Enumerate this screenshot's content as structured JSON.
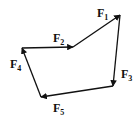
{
  "diagram": {
    "type": "force-vector-polygon",
    "vectors": [
      {
        "id": "F1",
        "label": "F",
        "sub": "1",
        "from": [
          73,
          47
        ],
        "to": [
          120,
          15
        ],
        "label_pos": [
          97,
          17
        ]
      },
      {
        "id": "F2",
        "label": "F",
        "sub": "2",
        "from": [
          22,
          48
        ],
        "to": [
          73,
          47
        ],
        "label_pos": [
          53,
          42
        ]
      },
      {
        "id": "F3",
        "label": "F",
        "sub": "3",
        "from": [
          120,
          15
        ],
        "to": [
          113,
          86
        ],
        "label_pos": [
          121,
          78
        ]
      },
      {
        "id": "F4",
        "label": "F",
        "sub": "4",
        "from": [
          41,
          97
        ],
        "to": [
          22,
          48
        ],
        "label_pos": [
          10,
          68
        ]
      },
      {
        "id": "F5",
        "label": "F",
        "sub": "5",
        "from": [
          113,
          86
        ],
        "to": [
          41,
          97
        ],
        "label_pos": [
          53,
          112
        ]
      }
    ],
    "colors": {
      "stroke": "#111111",
      "background": "#ffffff"
    }
  }
}
